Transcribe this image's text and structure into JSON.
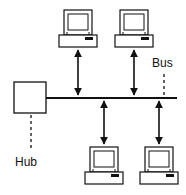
{
  "diagram": {
    "type": "bus-topology",
    "labels": {
      "bus": "Bus",
      "hub": "Hub"
    },
    "nodes": [
      {
        "id": "pc-top-left",
        "kind": "computer",
        "position": "top",
        "x": 59
      },
      {
        "id": "pc-top-right",
        "kind": "computer",
        "position": "top",
        "x": 115
      },
      {
        "id": "pc-bottom-left",
        "kind": "computer",
        "position": "bottom",
        "x": 85
      },
      {
        "id": "pc-bottom-right",
        "kind": "computer",
        "position": "bottom",
        "x": 140
      },
      {
        "id": "hub",
        "kind": "hub-box"
      }
    ],
    "colors": {
      "stroke": "#111111",
      "background": "#ffffff",
      "screen": "#ffffff"
    }
  }
}
